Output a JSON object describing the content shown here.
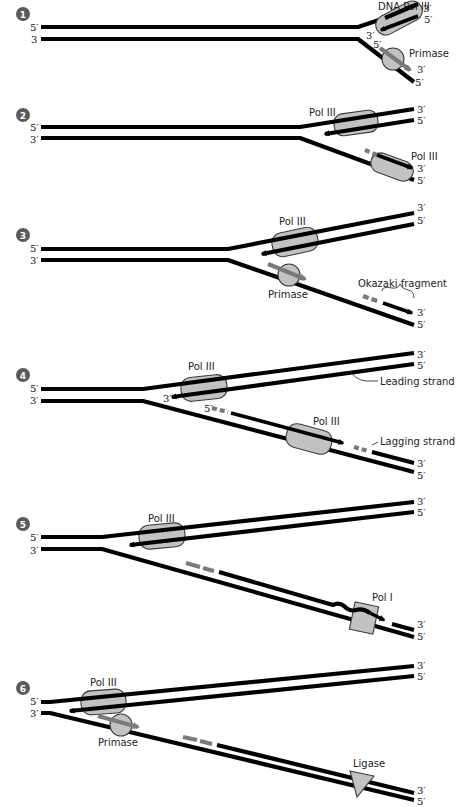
{
  "steps": [
    {
      "number": "1",
      "labels": {
        "enzyme1": "DNA Pol III",
        "enzyme2": "Primase"
      },
      "ends": {
        "left_top": "5′",
        "left_bottom": "3",
        "right_top_a": "3′",
        "right_top_b": "5′",
        "inner_3": "3′",
        "inner_5": "5′",
        "right_bot_a": "3′",
        "right_bot_b": "5′"
      }
    },
    {
      "number": "2",
      "labels": {
        "enzyme1": "Pol III",
        "enzyme2": "Pol III"
      },
      "ends": {
        "left_top": "5′",
        "left_bottom": "3′",
        "right_top_a": "3′",
        "right_top_b": "5′",
        "right_bot_a": "3′",
        "right_bot_b": "5′"
      }
    },
    {
      "number": "3",
      "labels": {
        "enzyme1": "Pol III",
        "enzyme2": "Primase",
        "annotation": "Okazaki fragment"
      },
      "ends": {
        "left_top": "5′",
        "left_bottom": "3′",
        "right_top_a": "3′",
        "right_top_b": "5′",
        "right_bot_a": "3′",
        "right_bot_b": "5′"
      }
    },
    {
      "number": "4",
      "labels": {
        "enzyme1": "Pol III",
        "enzyme2": "Pol III",
        "leading": "Leading strand",
        "lagging": "Lagging strand"
      },
      "ends": {
        "left_top": "5′",
        "left_bottom": "3′",
        "right_top_a": "3′",
        "right_top_b": "5′",
        "inner_3": "3′",
        "inner_5": "5′",
        "right_bot_a": "3′",
        "right_bot_b": "5′"
      }
    },
    {
      "number": "5",
      "labels": {
        "enzyme1": "Pol III",
        "enzyme2": "Pol I"
      },
      "ends": {
        "left_top": "5′",
        "left_bottom": "3′",
        "right_top_a": "3′",
        "right_top_b": "5′",
        "right_bot_a": "3′",
        "right_bot_b": "5′"
      }
    },
    {
      "number": "6",
      "labels": {
        "enzyme1": "Pol III",
        "enzyme2": "Primase",
        "enzyme3": "Ligase"
      },
      "ends": {
        "left_top": "5′",
        "left_bottom": "3′",
        "right_top_a": "3′",
        "right_top_b": "5′",
        "right_bot_a": "3′",
        "right_bot_b": "5′"
      }
    }
  ],
  "colors": {
    "strand": "#000000",
    "primer": "#7a7a7a",
    "enzyme_fill": "#c2c2c2",
    "step_badge": "#5a5a5a"
  }
}
